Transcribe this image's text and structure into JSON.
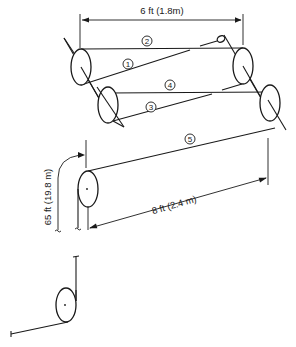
{
  "diagram": {
    "type": "pulley-rope-routing",
    "dimensions": {
      "top_width": "6 ft (1.8m)",
      "bottom_width": "8 ft (2.4 m)",
      "vertical_drop": "65 ft (19.8 m)"
    },
    "strand_labels": [
      {
        "id": "1",
        "label": "1"
      },
      {
        "id": "2",
        "label": "2"
      },
      {
        "id": "3",
        "label": "3"
      },
      {
        "id": "4",
        "label": "4"
      },
      {
        "id": "5",
        "label": "5"
      }
    ],
    "colors": {
      "line": "#1a1a1a",
      "background": "#ffffff"
    }
  }
}
